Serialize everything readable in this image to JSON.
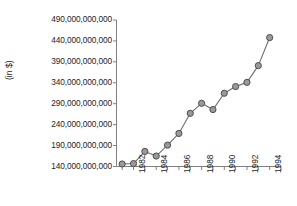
{
  "chart_data": {
    "type": "line",
    "title": "",
    "subtitle": "",
    "xlabel": "",
    "ylabel": "(in $)",
    "x": [
      1981,
      1982,
      1983,
      1984,
      1985,
      1986,
      1987,
      1988,
      1989,
      1990,
      1991,
      1992,
      1993,
      1994
    ],
    "values": [
      146000000000,
      147000000000,
      176000000000,
      165000000000,
      191000000000,
      219000000000,
      267000000000,
      291000000000,
      276000000000,
      315000000000,
      331000000000,
      341000000000,
      381000000000,
      448000000000
    ],
    "series": [
      {
        "name": "Amount",
        "values": [
          146000000000,
          147000000000,
          176000000000,
          165000000000,
          191000000000,
          219000000000,
          267000000000,
          291000000000,
          276000000000,
          315000000000,
          331000000000,
          341000000000,
          381000000000,
          448000000000
        ]
      }
    ],
    "ylim": [
      140000000000,
      490000000000
    ],
    "xlim": [
      1980.5,
      1995.0
    ],
    "ytick_values": [
      140000000000,
      190000000000,
      240000000000,
      290000000000,
      340000000000,
      390000000000,
      440000000000,
      490000000000
    ],
    "ytick_labels": [
      "140,000,000,000",
      "190,000,000,000",
      "240,000,000,000",
      "290,000,000,000",
      "340,000,000,000",
      "390,000,000,000",
      "440,000,000,000",
      "490,000,000,000"
    ],
    "xtick_values": [
      1981,
      1982,
      1983,
      1984,
      1985,
      1986,
      1987,
      1988,
      1989,
      1990,
      1991,
      1992,
      1993,
      1994,
      1995
    ],
    "xtick_labels": [
      "",
      "1982",
      "",
      "1984",
      "",
      "1986",
      "",
      "1988",
      "",
      "1990",
      "",
      "1992",
      "",
      "1994",
      ""
    ],
    "grid": false,
    "legend": false,
    "legend_position": "none",
    "colors": {
      "line": "#6e6e6e",
      "marker_fill": "#9a9a9a",
      "marker_edge": "#4d4d4d",
      "axis": "#808080",
      "text": "#1d1d1d",
      "background": "#ffffff"
    }
  }
}
